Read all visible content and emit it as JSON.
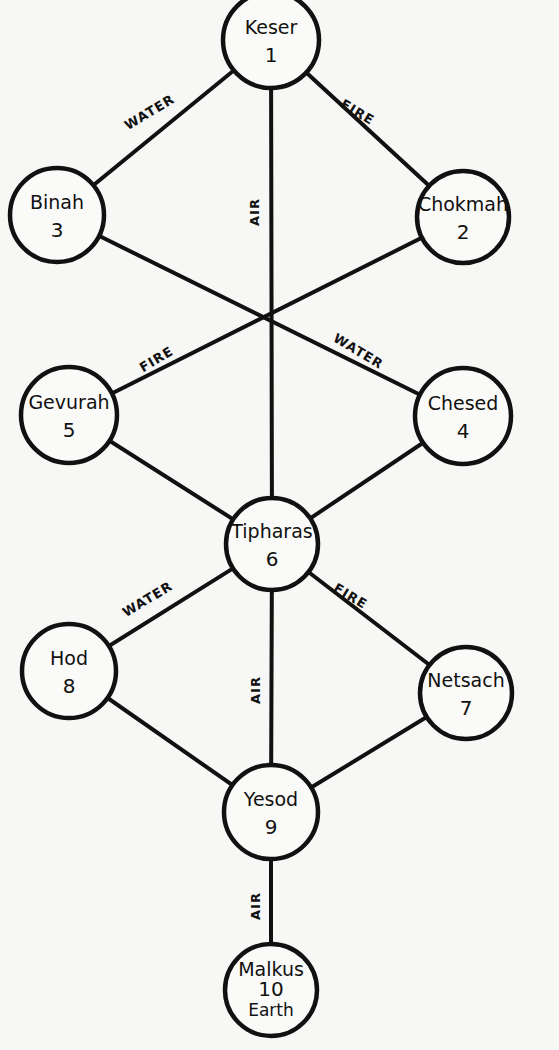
{
  "diagram": {
    "type": "tree-of-life",
    "nodes": [
      {
        "id": "keser",
        "name": "Keser",
        "number": "1",
        "extra": "",
        "x": 271,
        "y": 40,
        "r": 48
      },
      {
        "id": "chokmah",
        "name": "Chokmah",
        "number": "2",
        "extra": "",
        "x": 463,
        "y": 217,
        "r": 46
      },
      {
        "id": "binah",
        "name": "Binah",
        "number": "3",
        "extra": "",
        "x": 57,
        "y": 215,
        "r": 47
      },
      {
        "id": "chesed",
        "name": "Chesed",
        "number": "4",
        "extra": "",
        "x": 463,
        "y": 416,
        "r": 48
      },
      {
        "id": "gevurah",
        "name": "Gevurah",
        "number": "5",
        "extra": "",
        "x": 69,
        "y": 415,
        "r": 48
      },
      {
        "id": "tipharas",
        "name": "Tipharas",
        "number": "6",
        "extra": "",
        "x": 272,
        "y": 544,
        "r": 46
      },
      {
        "id": "netsach",
        "name": "Netsach",
        "number": "7",
        "extra": "",
        "x": 466,
        "y": 693,
        "r": 46
      },
      {
        "id": "hod",
        "name": "Hod",
        "number": "8",
        "extra": "",
        "x": 69,
        "y": 671,
        "r": 47
      },
      {
        "id": "yesod",
        "name": "Yesod",
        "number": "9",
        "extra": "",
        "x": 271,
        "y": 812,
        "r": 47
      },
      {
        "id": "malkus",
        "name": "Malkus",
        "number": "10",
        "extra": "Earth",
        "x": 271,
        "y": 990,
        "r": 46
      }
    ],
    "edges": [
      {
        "from": "keser",
        "to": "binah",
        "label": "WATER"
      },
      {
        "from": "keser",
        "to": "chokmah",
        "label": "FIRE"
      },
      {
        "from": "keser",
        "to": "tipharas",
        "label": "AIR"
      },
      {
        "from": "binah",
        "to": "chesed",
        "label": "WATER"
      },
      {
        "from": "chokmah",
        "to": "gevurah",
        "label": "FIRE"
      },
      {
        "from": "gevurah",
        "to": "tipharas",
        "label": ""
      },
      {
        "from": "chesed",
        "to": "tipharas",
        "label": ""
      },
      {
        "from": "tipharas",
        "to": "hod",
        "label": "WATER"
      },
      {
        "from": "tipharas",
        "to": "netsach",
        "label": "FIRE"
      },
      {
        "from": "tipharas",
        "to": "yesod",
        "label": "AIR"
      },
      {
        "from": "hod",
        "to": "yesod",
        "label": ""
      },
      {
        "from": "netsach",
        "to": "yesod",
        "label": ""
      },
      {
        "from": "yesod",
        "to": "malkus",
        "label": "AIR"
      }
    ],
    "edge_labels": [
      {
        "text": "WATER",
        "x": 150,
        "y": 113,
        "angle": -31
      },
      {
        "text": "FIRE",
        "x": 357,
        "y": 113,
        "angle": 31
      },
      {
        "text": "AIR",
        "x": 255,
        "y": 212,
        "angle": -90
      },
      {
        "text": "FIRE",
        "x": 157,
        "y": 360,
        "angle": -31
      },
      {
        "text": "WATER",
        "x": 358,
        "y": 352,
        "angle": 31
      },
      {
        "text": "WATER",
        "x": 148,
        "y": 600,
        "angle": -31
      },
      {
        "text": "FIRE",
        "x": 350,
        "y": 597,
        "angle": 31
      },
      {
        "text": "AIR",
        "x": 256,
        "y": 690,
        "angle": -90
      },
      {
        "text": "AIR",
        "x": 256,
        "y": 906,
        "angle": -90
      }
    ]
  },
  "colors": {
    "ink": "#111111",
    "paper": "#f7f7f5"
  }
}
